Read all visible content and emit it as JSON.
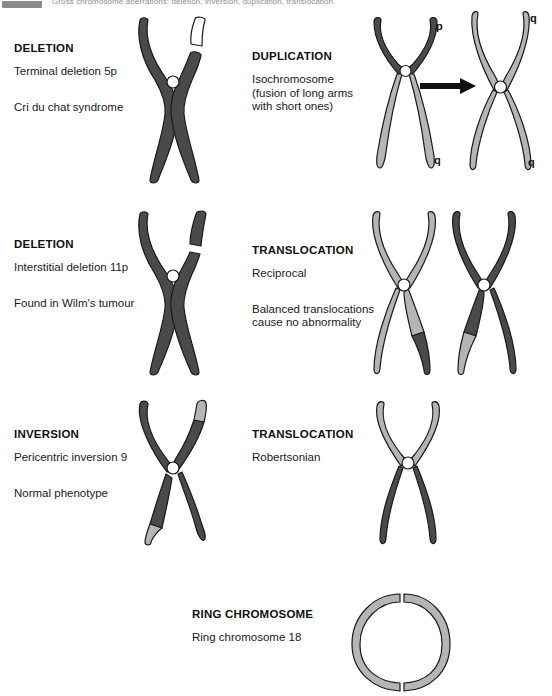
{
  "topbar": {
    "caption": "Gross chromosome aberrations: deletion, inversion, duplication, translocation."
  },
  "sections": [
    {
      "id": "deletion-terminal",
      "heading": "DELETION",
      "line1": "Terminal deletion 5p",
      "line2": "Cri du chat syndrome"
    },
    {
      "id": "duplication",
      "heading": "DUPLICATION",
      "line1": "Isochromosome",
      "line2": "(fusion of long arms",
      "line3": "with short ones)"
    },
    {
      "id": "deletion-interstitial",
      "heading": "DELETION",
      "line1": "Interstitial deletion 11p",
      "line2": "Found in Wilm's tumour"
    },
    {
      "id": "translocation-reciprocal",
      "heading": "TRANSLOCATION",
      "line1": "Reciprocal",
      "line2": "Balanced translocations",
      "line3": "cause no abnormality"
    },
    {
      "id": "inversion",
      "heading": "INVERSION",
      "line1": "Pericentric inversion 9",
      "line2": "Normal phenotype"
    },
    {
      "id": "translocation-robertsonian",
      "heading": "TRANSLOCATION",
      "line1": "Robertsonian"
    },
    {
      "id": "ring-chromosome",
      "heading": "RING CHROMOSOME",
      "line1": "Ring chromosome 18"
    }
  ],
  "arm_labels": {
    "p": "p",
    "q": "q"
  },
  "colors": {
    "dark_chromatid": "#4a4a4a",
    "light_chromatid": "#b5b5b5",
    "mid_chromatid": "#707070",
    "outline": "#1a1a1a",
    "centromere_fill": "#ffffff",
    "background": "#ffffff",
    "arrow": "#111111"
  }
}
